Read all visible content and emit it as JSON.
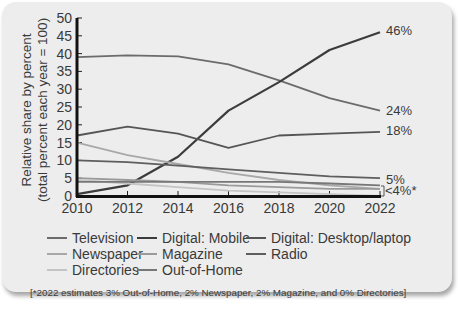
{
  "chart_data": {
    "type": "line",
    "title": "",
    "xlabel": "",
    "ylabel": "Relative share by percent (total percent each year = 100)",
    "ylabel_lines": [
      "Relative share by percent",
      "(total percent each year = 100)"
    ],
    "ylim": [
      0,
      50
    ],
    "yticks": [
      0,
      5,
      10,
      15,
      20,
      25,
      30,
      35,
      40,
      45,
      50
    ],
    "x": [
      2010,
      2012,
      2014,
      2016,
      2018,
      2020,
      2022
    ],
    "xticks": [
      "2010",
      "2012",
      "2014",
      "2016",
      "2018",
      "2020",
      "2022"
    ],
    "grid": false,
    "legend_position": "bottom",
    "series": [
      {
        "name": "Television",
        "color": "#6b6b6b",
        "values": [
          39,
          39.5,
          39.2,
          37,
          32.5,
          27.5,
          24
        ]
      },
      {
        "name": "Digital: Mobile",
        "color": "#3c3c3c",
        "values": [
          0.5,
          3,
          11,
          24,
          32,
          41,
          46
        ]
      },
      {
        "name": "Digital: Desktop/laptop",
        "color": "#555555",
        "values": [
          17,
          19.5,
          17.5,
          13.5,
          17,
          17.5,
          18
        ]
      },
      {
        "name": "Newspaper",
        "color": "#a8a8a8",
        "values": [
          15,
          11.5,
          9,
          6.5,
          4.5,
          3,
          2
        ]
      },
      {
        "name": "Magazine",
        "color": "#9a9a9a",
        "values": [
          5,
          4.5,
          4,
          3,
          2.5,
          2,
          2
        ]
      },
      {
        "name": "Radio",
        "color": "#5e5e5e",
        "values": [
          10,
          9.5,
          8.5,
          7.5,
          6.5,
          5.5,
          5
        ]
      },
      {
        "name": "Directories",
        "color": "#c4c4c4",
        "values": [
          4.5,
          3.5,
          2.5,
          1.5,
          1,
          0.5,
          0
        ]
      },
      {
        "name": "Out-of-Home",
        "color": "#777777",
        "values": [
          4,
          4,
          4,
          4,
          4,
          3.5,
          3
        ]
      }
    ],
    "annotations": [
      "46%",
      "24%",
      "18%",
      "5%",
      "<4%*"
    ]
  },
  "end_labels": {
    "mobile": "46%",
    "tv": "24%",
    "desktop": "18%",
    "radio": "5%",
    "others": "<4%*"
  },
  "y_axis_label": {
    "line1": "Relative share by percent",
    "line2": "(total percent each year = 100)"
  },
  "legend": {
    "television": "Television",
    "mobile": "Digital: Mobile",
    "desktop": "Digital: Desktop/laptop",
    "newspaper": "Newspaper",
    "magazine": "Magazine",
    "radio": "Radio",
    "directories": "Directories",
    "ooh": "Out-of-Home"
  },
  "footnote": "[*2022 estimates 3% Out-of-Home, 2% Newspaper, 2% Magazine, and 0% Directories]"
}
